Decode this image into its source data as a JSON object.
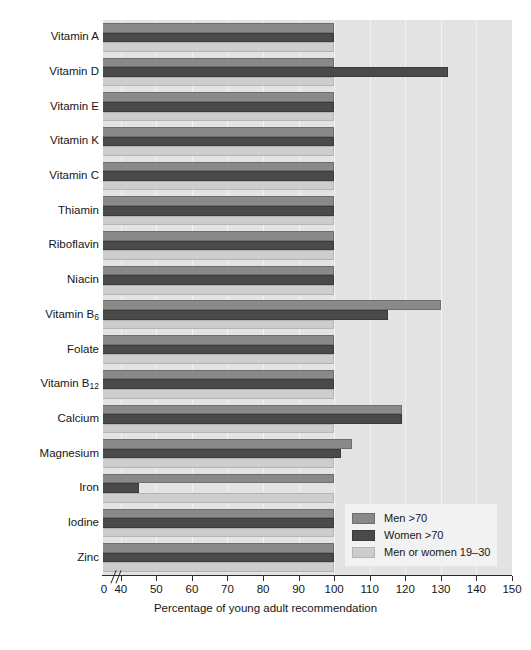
{
  "chart_data": {
    "type": "bar",
    "orientation": "horizontal",
    "title": "",
    "xlabel": "Percentage of young adult recommendation",
    "ylabel": "",
    "xlim": [
      35,
      150
    ],
    "axis_break_after": 0,
    "grid": true,
    "grid_axis": "x",
    "legend_position": "bottom-right",
    "xticks": [
      0,
      40,
      50,
      60,
      70,
      80,
      90,
      100,
      110,
      120,
      130,
      140,
      150
    ],
    "xticklabels": [
      "0",
      "40",
      "50",
      "60",
      "70",
      "80",
      "90",
      "100",
      "110",
      "120",
      "130",
      "140",
      "150"
    ],
    "categories": [
      "Vitamin A",
      "Vitamin D",
      "Vitamin E",
      "Vitamin K",
      "Vitamin C",
      "Thiamin",
      "Riboflavin",
      "Niacin",
      "Vitamin B6",
      "Folate",
      "Vitamin B12",
      "Calcium",
      "Magnesium",
      "Iron",
      "Iodine",
      "Zinc"
    ],
    "category_labels_html": [
      "Vitamin A",
      "Vitamin D",
      "Vitamin E",
      "Vitamin K",
      "Vitamin C",
      "Thiamin",
      "Riboflavin",
      "Niacin",
      "Vitamin B<sub>6</sub>",
      "Folate",
      "Vitamin B<sub>12</sub>",
      "Calcium",
      "Magnesium",
      "Iron",
      "Iodine",
      "Zinc"
    ],
    "series": [
      {
        "name": "Men >70",
        "key": "men",
        "color": "#898989",
        "values": [
          100,
          100,
          100,
          100,
          100,
          100,
          100,
          100,
          130,
          100,
          100,
          119,
          105,
          100,
          100,
          100
        ]
      },
      {
        "name": "Women >70",
        "key": "women",
        "color": "#4a4a4a",
        "values": [
          100,
          132,
          100,
          100,
          100,
          100,
          100,
          100,
          115,
          100,
          100,
          119,
          102,
          45,
          100,
          100
        ]
      },
      {
        "name": "Men or women 19–30",
        "key": "young",
        "color": "#cdcdcd",
        "values": [
          100,
          100,
          100,
          100,
          100,
          100,
          100,
          100,
          100,
          100,
          100,
          100,
          100,
          100,
          100,
          100
        ]
      }
    ]
  },
  "legend": {
    "items": [
      {
        "label": "Men >70",
        "key": "men"
      },
      {
        "label": "Women >70",
        "key": "women"
      },
      {
        "label": "Men or women 19–30",
        "key": "young"
      }
    ]
  },
  "colors": {
    "men": "#898989",
    "women": "#4a4a4a",
    "young": "#cdcdcd",
    "plot_background": "#e3e3e3",
    "gridline": "#f2f2f2",
    "legend_background": "#f2f2f2",
    "axis": "#2a2a2a",
    "text": "#161616"
  }
}
